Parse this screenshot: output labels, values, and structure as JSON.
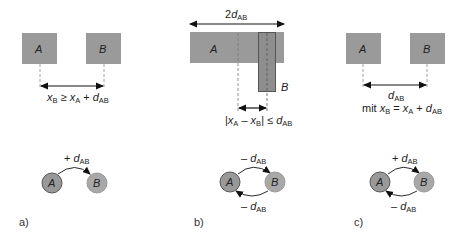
{
  "figure": {
    "colors": {
      "box_fill": "#9a9a9a",
      "box_b_fill": "#8e8e8e",
      "outline": "#555555",
      "circle_a_fill": "#999999",
      "circle_b_fill": "#a8a8a8",
      "line": "#111111",
      "dash": "#888888"
    },
    "panels": [
      {
        "id": "a",
        "label": "a)",
        "box_a": "A",
        "box_b": "B",
        "constraint": {
          "x_b": "x",
          "x_b_sub": "B",
          "rel": " ≥ ",
          "x_a": "x",
          "x_a_sub": "A",
          "plus": " + ",
          "d": "d",
          "d_sub": "AB"
        },
        "graph": {
          "node_a": "A",
          "node_b": "B",
          "edge_top_sign": "+ ",
          "edge_top_d": "d",
          "edge_top_sub": "AB"
        }
      },
      {
        "id": "b",
        "label": "b)",
        "box_a": "A",
        "box_b": "B",
        "top_span": {
          "prefix": "2",
          "d": "d",
          "d_sub": "AB"
        },
        "constraint": {
          "open": "|",
          "x_a": "x",
          "x_a_sub": "A",
          "minus": " – ",
          "x_b": "x",
          "x_b_sub": "B",
          "close": "|",
          "rel": " ≤ ",
          "d": "d",
          "d_sub": "AB"
        },
        "graph": {
          "node_a": "A",
          "node_b": "B",
          "edge_top_sign": "– ",
          "edge_top_d": "d",
          "edge_top_sub": "AB",
          "edge_bottom_sign": "– ",
          "edge_bottom_d": "d",
          "edge_bottom_sub": "AB"
        }
      },
      {
        "id": "c",
        "label": "c)",
        "box_a": "A",
        "box_b": "B",
        "distance": {
          "d": "d",
          "d_sub": "AB"
        },
        "constraint": {
          "prefix": "mit ",
          "x_b": "x",
          "x_b_sub": "B",
          "rel": " = ",
          "x_a": "x",
          "x_a_sub": "A",
          "plus": " + ",
          "d": "d",
          "d_sub": "AB"
        },
        "graph": {
          "node_a": "A",
          "node_b": "B",
          "edge_top_sign": "+ ",
          "edge_top_d": "d",
          "edge_top_sub": "AB",
          "edge_bottom_sign": "– ",
          "edge_bottom_d": "d",
          "edge_bottom_sub": "AB"
        }
      }
    ]
  }
}
